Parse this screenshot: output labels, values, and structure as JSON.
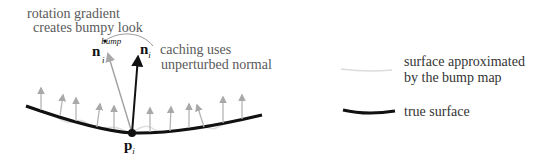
{
  "annotations": {
    "rotation_line1": "rotation gradient",
    "rotation_line2": "creates bumpy look",
    "caching_line1": "caching uses",
    "caching_line2": "unperturbed normal"
  },
  "symbols": {
    "n_bump": "n",
    "n_bump_sup": "bump",
    "n_bump_sub": "i",
    "n_i": "n",
    "n_i_sub": "i",
    "p_i": "p",
    "p_i_sub": "i"
  },
  "legend": {
    "items": [
      {
        "label_line1": "surface approximated",
        "label_line2": "by the bump map",
        "style": "thin light gray curve"
      },
      {
        "label": "true surface",
        "style": "thick black curve"
      }
    ]
  },
  "colors": {
    "true_surface": "#111111",
    "bump_surface": "#d8d8d8",
    "perturbed_normals": "#a8a8a8",
    "unperturbed_normal": "#111111",
    "text": "#5a5a5a"
  }
}
